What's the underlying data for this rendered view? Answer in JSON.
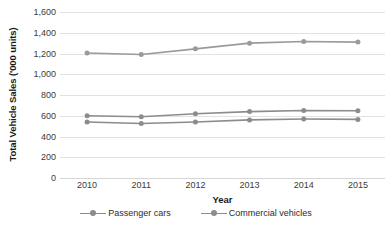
{
  "chart_data": {
    "type": "line",
    "title": "",
    "xlabel": "Year",
    "ylabel": "Total Vehicle Sales ('000 units)",
    "categories": [
      "2010",
      "2011",
      "2012",
      "2013",
      "2014",
      "2015"
    ],
    "ylim": [
      0,
      1600
    ],
    "yticks": [
      0,
      200,
      400,
      600,
      800,
      1000,
      1200,
      1400,
      1600
    ],
    "ytick_labels": [
      "0",
      "200",
      "400",
      "600",
      "800",
      "1,000",
      "1,200",
      "1,400",
      "1,600"
    ],
    "grid": true,
    "legend_position": "bottom",
    "series": [
      {
        "name": "Total vehicles",
        "values": [
          1205,
          1190,
          1245,
          1300,
          1315,
          1310
        ],
        "color": "#9a9a9a",
        "in_legend": false
      },
      {
        "name": "Commercial vehicles",
        "values": [
          600,
          590,
          620,
          640,
          650,
          648
        ],
        "color": "#8c8c8c",
        "in_legend": true
      },
      {
        "name": "Passenger cars",
        "values": [
          540,
          525,
          540,
          560,
          568,
          565
        ],
        "color": "#8c8c8c",
        "in_legend": true
      }
    ]
  },
  "legend": {
    "items": [
      {
        "label": "Passenger cars",
        "color": "#8c8c8c"
      },
      {
        "label": "Commercial vehicles",
        "color": "#8c8c8c"
      }
    ]
  },
  "colors": {
    "gridline": "#e2e2e2",
    "axis_text": "#3b3b3b",
    "title_text": "#1a1a1a",
    "series_gray": "#8c8c8c",
    "background": "#ffffff"
  }
}
